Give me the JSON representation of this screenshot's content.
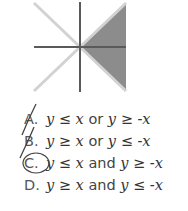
{
  "graph": {
    "description": "Coordinate axes with lines y=x and y=-x; region to the right between them shaded",
    "shade_color": "#8c8c8c",
    "axis_color": "#555555",
    "line_color": "#d0d0d0"
  },
  "options": [
    {
      "letter": "A.",
      "lhs": "y",
      "rel1": "≤",
      "v1": "x",
      "join": "or",
      "lhs2": "y",
      "rel2": "≥",
      "v2": "-x",
      "marked": "crossed"
    },
    {
      "letter": "B.",
      "lhs": "y",
      "rel1": "≥",
      "v1": "x",
      "join": "or",
      "lhs2": "y",
      "rel2": "≤",
      "v2": "-x",
      "marked": "crossed"
    },
    {
      "letter": "C.",
      "lhs": "y",
      "rel1": "≤",
      "v1": "x",
      "join": "and",
      "lhs2": "y",
      "rel2": "≥",
      "v2": "-x",
      "marked": "circled"
    },
    {
      "letter": "D.",
      "lhs": "y",
      "rel1": "≥",
      "v1": "x",
      "join": "and",
      "lhs2": "y",
      "rel2": "≤",
      "v2": "-x",
      "marked": "none"
    }
  ]
}
